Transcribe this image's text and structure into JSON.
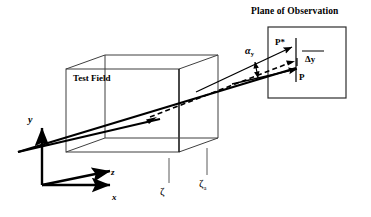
{
  "figure": {
    "title_plane": "Plane of Observation",
    "test_field_label": "Test Field",
    "labels": {
      "point_deflected": "P*",
      "point_undeflected": "P",
      "delta_y": "Δy",
      "alpha": "α",
      "alpha_subscript": "y",
      "axis_y": "y",
      "axis_z": "z",
      "axis_x": "x",
      "zeta": "ζ",
      "zeta_a": "ζ",
      "zeta_a_subscript": "a"
    },
    "colors": {
      "ink": "#000000",
      "background": "#ffffff",
      "box_edge": "#3a3a3a",
      "tick_line": "#5a5a5a"
    }
  }
}
